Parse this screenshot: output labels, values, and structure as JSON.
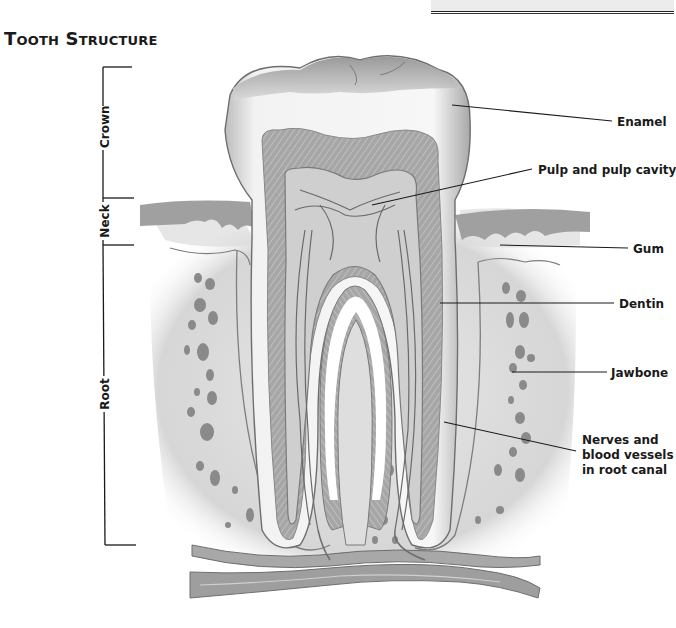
{
  "title": "Tooth Structure",
  "regions": [
    {
      "id": "crown",
      "label": "Crown"
    },
    {
      "id": "neck",
      "label": "Neck"
    },
    {
      "id": "root",
      "label": "Root"
    }
  ],
  "labels": [
    {
      "id": "enamel",
      "text": "Enamel"
    },
    {
      "id": "pulp",
      "text": "Pulp and pulp cavity"
    },
    {
      "id": "gum",
      "text": "Gum"
    },
    {
      "id": "dentin",
      "text": "Dentin"
    },
    {
      "id": "jawbone",
      "text": "Jawbone"
    },
    {
      "id": "nerves",
      "lines": [
        "Nerves and",
        "blood vessels",
        "in root canal"
      ]
    }
  ],
  "colors": {
    "line": "#1a1a1a",
    "enamel": "#f4f4f4",
    "dentin": "#a9a9a9",
    "pulp": "#cfcfcf",
    "gum": "#9a9a9a",
    "bone": "#e2e2e2",
    "bone_hole": "#8c8c8c"
  }
}
